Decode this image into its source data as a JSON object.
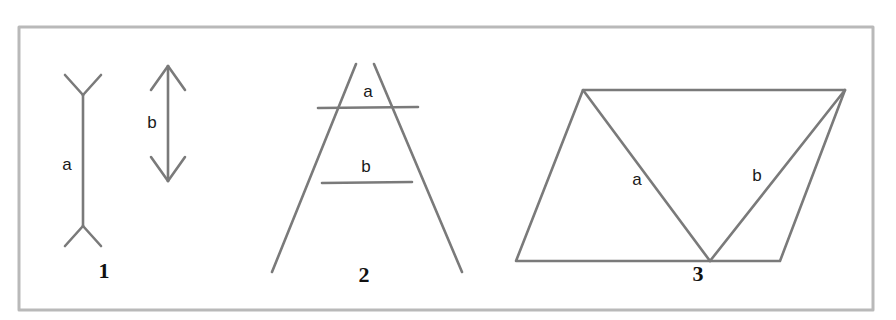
{
  "figure": {
    "width": 896,
    "height": 320,
    "background_color": "#ffffff",
    "line_color": "#7a7a7a",
    "frame_color": "#b9b9b9",
    "label_color": "#1a1a1a",
    "number_color": "#111111",
    "line_width": 2.6,
    "frame": {
      "x": 19,
      "y": 27,
      "width": 854,
      "height": 283,
      "stroke_width": 3
    },
    "panels": [
      {
        "id": "panel-1",
        "number": "1",
        "name": "muller-lyer",
        "number_position": {
          "x": 104,
          "y": 273
        },
        "segments": [
          {
            "label": "a",
            "label_position": {
              "x": 67,
              "y": 166
            },
            "shaft": {
              "x1": 83,
              "y1": 95,
              "x2": 83,
              "y2": 226
            },
            "fin_style": "inward",
            "fins": [
              {
                "x1": 83,
                "y1": 95,
                "x2": 65,
                "y2": 75
              },
              {
                "x1": 83,
                "y1": 95,
                "x2": 101,
                "y2": 75
              },
              {
                "x1": 83,
                "y1": 226,
                "x2": 65,
                "y2": 246
              },
              {
                "x1": 83,
                "y1": 226,
                "x2": 101,
                "y2": 246
              }
            ]
          },
          {
            "label": "b",
            "label_position": {
              "x": 152,
              "y": 124
            },
            "shaft": {
              "x1": 168,
              "y1": 66,
              "x2": 168,
              "y2": 181
            },
            "fin_style": "outward",
            "fins": [
              {
                "x1": 168,
                "y1": 66,
                "x2": 151,
                "y2": 90
              },
              {
                "x1": 168,
                "y1": 66,
                "x2": 185,
                "y2": 90
              },
              {
                "x1": 168,
                "y1": 181,
                "x2": 151,
                "y2": 157
              },
              {
                "x1": 168,
                "y1": 181,
                "x2": 185,
                "y2": 157
              }
            ]
          }
        ]
      },
      {
        "id": "panel-2",
        "number": "2",
        "name": "ponzo",
        "number_position": {
          "x": 364,
          "y": 277
        },
        "rails": [
          {
            "x1": 356,
            "y1": 64,
            "x2": 272,
            "y2": 272
          },
          {
            "x1": 374,
            "y1": 64,
            "x2": 462,
            "y2": 272
          }
        ],
        "segments": [
          {
            "label": "a",
            "label_position": {
              "x": 368,
              "y": 93
            },
            "bar": {
              "x1": 318,
              "y1": 108,
              "x2": 418,
              "y2": 107
            }
          },
          {
            "label": "b",
            "label_position": {
              "x": 366,
              "y": 168
            },
            "bar": {
              "x1": 322,
              "y1": 183,
              "x2": 412,
              "y2": 182
            }
          }
        ]
      },
      {
        "id": "panel-3",
        "number": "3",
        "name": "sander-parallelogram",
        "number_position": {
          "x": 698,
          "y": 276
        },
        "parallelogram": [
          {
            "x": 583,
            "y": 90
          },
          {
            "x": 845,
            "y": 90
          },
          {
            "x": 780,
            "y": 261
          },
          {
            "x": 516,
            "y": 261
          }
        ],
        "segments": [
          {
            "label": "a",
            "label_position": {
              "x": 637,
              "y": 181
            },
            "diagonal": {
              "x1": 583,
              "y1": 90,
              "x2": 710,
              "y2": 261
            }
          },
          {
            "label": "b",
            "label_position": {
              "x": 757,
              "y": 177
            },
            "diagonal": {
              "x1": 845,
              "y1": 90,
              "x2": 710,
              "y2": 261
            }
          }
        ]
      }
    ]
  }
}
